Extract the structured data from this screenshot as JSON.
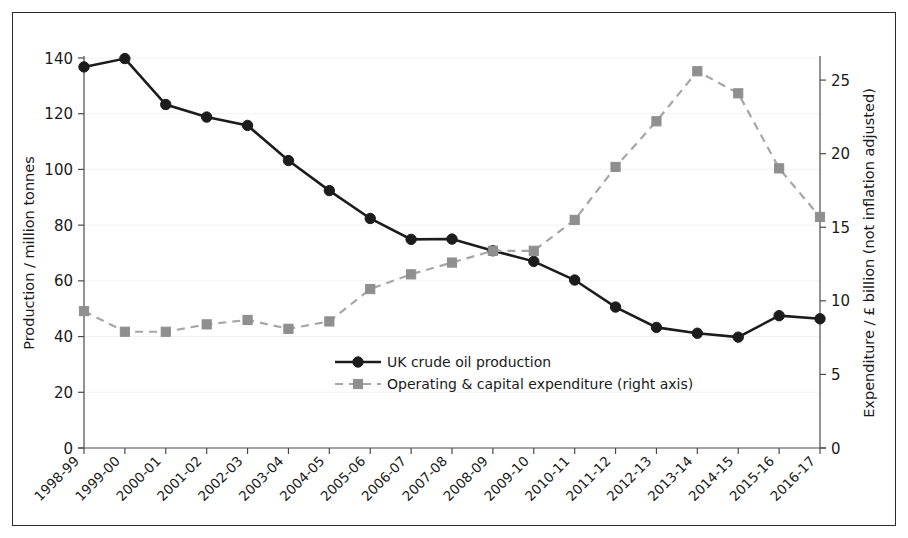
{
  "figure": {
    "background": "#ffffff",
    "frame_color": "#2b2b2b"
  },
  "chart_data": {
    "type": "line",
    "title": "",
    "xlabel": "",
    "ylabel": "Production / million tonnes",
    "y2label": "Expenditure / £ billion (not inflation adjusted)",
    "grid": false,
    "legend_position": "center",
    "categories": [
      "1998-99",
      "1999-00",
      "2000-01",
      "2001-02",
      "2002-03",
      "2003-04",
      "2004-05",
      "2005-06",
      "2006-07",
      "2007-08",
      "2008-09",
      "2009-10",
      "2010-11",
      "2011-12",
      "2012-13",
      "2013-14",
      "2014-15",
      "2015-16",
      "2016-17"
    ],
    "ylim": [
      0,
      140
    ],
    "yticks": [
      0,
      20,
      40,
      60,
      80,
      100,
      120,
      140
    ],
    "ytick_labels": [
      "0",
      "20",
      "40",
      "60",
      "80",
      "100",
      "120",
      "140"
    ],
    "y2lim": [
      0,
      26.5
    ],
    "y2ticks": [
      0,
      5,
      10,
      15,
      20,
      25
    ],
    "y2tick_labels": [
      "0",
      "5",
      "10",
      "15",
      "20",
      "25"
    ],
    "series": [
      {
        "name": "UK crude oil production",
        "axis": "left",
        "color": "#1c1c1c",
        "marker": "circle",
        "linestyle": "solid",
        "values": [
          136.8,
          139.8,
          123.3,
          118.8,
          115.8,
          103.2,
          92.4,
          82.4,
          74.9,
          75.0,
          70.8,
          67.0,
          60.3,
          50.6,
          43.3,
          41.2,
          39.8,
          47.5,
          46.4
        ]
      },
      {
        "name": "Operating & capital expenditure (right axis)",
        "axis": "right",
        "color": "#8f8f8f",
        "marker": "square",
        "linestyle": "dashed",
        "values": [
          9.3,
          7.9,
          7.9,
          8.4,
          8.7,
          8.1,
          8.6,
          10.8,
          11.8,
          12.6,
          13.4,
          13.4,
          15.5,
          19.1,
          22.2,
          25.6,
          24.1,
          19.0,
          15.7
        ]
      }
    ]
  },
  "legend": {
    "entries": [
      {
        "label": "UK crude oil production",
        "marker": "circle",
        "color": "#1c1c1c"
      },
      {
        "label": "Operating & capital expenditure (right axis)",
        "marker": "square",
        "color": "#8f8f8f"
      }
    ]
  }
}
